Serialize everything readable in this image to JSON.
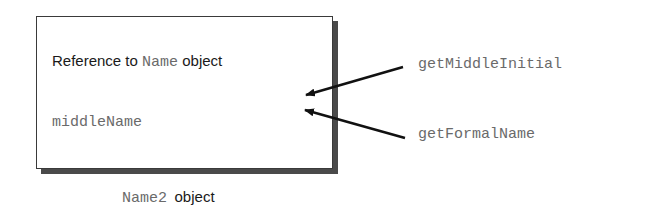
{
  "object_box": {
    "reference_prefix": "Reference to ",
    "reference_type": "Name",
    "reference_suffix": " object",
    "field_name": "middleName"
  },
  "caption": {
    "class_name": "Name2",
    "suffix": "object"
  },
  "methods": [
    {
      "name": "getMiddleInitial"
    },
    {
      "name": "getFormalName"
    }
  ]
}
